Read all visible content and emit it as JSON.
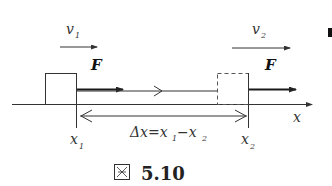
{
  "figure": {
    "caption_prefix": "图",
    "caption_number": "5.10"
  },
  "labels": {
    "v1": "v",
    "v1_sub": "1",
    "v2": "v",
    "v2_sub": "2",
    "force_left": "F",
    "force_right": "F",
    "x1": "x",
    "x1_sub": "1",
    "x2": "x",
    "x2_sub": "2",
    "axis": "x",
    "delta_x": "Δx=x",
    "delta_x_sub1": "1",
    "delta_x_minus": "−x",
    "delta_x_sub2": "2"
  },
  "colors": {
    "stroke": "#333333",
    "thick_arrow": "#1a1a1a",
    "dashed_box": "#555555"
  }
}
